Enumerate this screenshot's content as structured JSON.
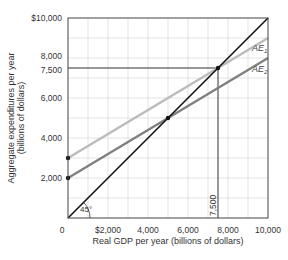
{
  "chart_data": {
    "type": "line",
    "title": "",
    "xlabel": "Real GDP per year (billions of dollars)",
    "ylabel_line1": "Aggregate expenditures per year",
    "ylabel_line2": "(billions of dollars)",
    "xlim": [
      0,
      10000
    ],
    "ylim": [
      0,
      10000
    ],
    "grid": true,
    "grid_step": 1000,
    "x_ticks": [
      {
        "value": 0,
        "label": "0"
      },
      {
        "value": 2000,
        "label": "$2,000"
      },
      {
        "value": 4000,
        "label": "4,000"
      },
      {
        "value": 6000,
        "label": "6,000"
      },
      {
        "value": 8000,
        "label": "8,000"
      },
      {
        "value": 10000,
        "label": "10,000"
      }
    ],
    "y_ticks": [
      {
        "value": 2000,
        "label": "2,000"
      },
      {
        "value": 4000,
        "label": "4,000"
      },
      {
        "value": 6000,
        "label": "6,000"
      },
      {
        "value": 7500,
        "label": "7,500"
      },
      {
        "value": 8000,
        "label": "8,000"
      },
      {
        "value": 10000,
        "label": "$10,000"
      }
    ],
    "series": [
      {
        "name": "45° line",
        "x": [
          0,
          10000
        ],
        "y": [
          0,
          10000
        ],
        "color": "#111111",
        "width": 1.6
      },
      {
        "name": "AE1",
        "label_main": "AE",
        "label_sub": "1",
        "x": [
          0,
          10000
        ],
        "y": [
          3000,
          9000
        ],
        "color": "#bbbbbb",
        "width": 2.4
      },
      {
        "name": "AE2",
        "label_main": "AE",
        "label_sub": "2",
        "x": [
          0,
          10000
        ],
        "y": [
          2000,
          8000
        ],
        "color": "#808080",
        "width": 2.4
      }
    ],
    "points": [
      {
        "x": 0,
        "y": 3000
      },
      {
        "x": 0,
        "y": 2000
      },
      {
        "x": 5000,
        "y": 5000
      },
      {
        "x": 7500,
        "y": 7500
      }
    ],
    "reference_lines": [
      {
        "orientation": "horizontal",
        "value": 7500,
        "from": 0,
        "to": 7500
      },
      {
        "orientation": "vertical",
        "value": 7500,
        "from": 0,
        "to": 7500,
        "label": "7,500"
      }
    ],
    "annotations": [
      {
        "text": "45°",
        "near": "origin angle arc"
      }
    ]
  }
}
